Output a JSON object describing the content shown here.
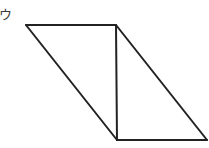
{
  "figure": {
    "label": "ウ",
    "shape": "parallelogram",
    "segments": [
      {
        "name": "top-edge",
        "from": "top-left",
        "to": "top-right"
      },
      {
        "name": "left-slanted-edge",
        "from": "top-left",
        "to": "bottom-left"
      },
      {
        "name": "vertical-divider",
        "from": "top-right",
        "to": "bottom-left"
      },
      {
        "name": "right-slanted-edge",
        "from": "top-right",
        "to": "bottom-right"
      },
      {
        "name": "bottom-edge",
        "from": "bottom-left",
        "to": "bottom-right"
      }
    ],
    "stroke_color": "#222222",
    "label_color": "#3a3a3a"
  }
}
